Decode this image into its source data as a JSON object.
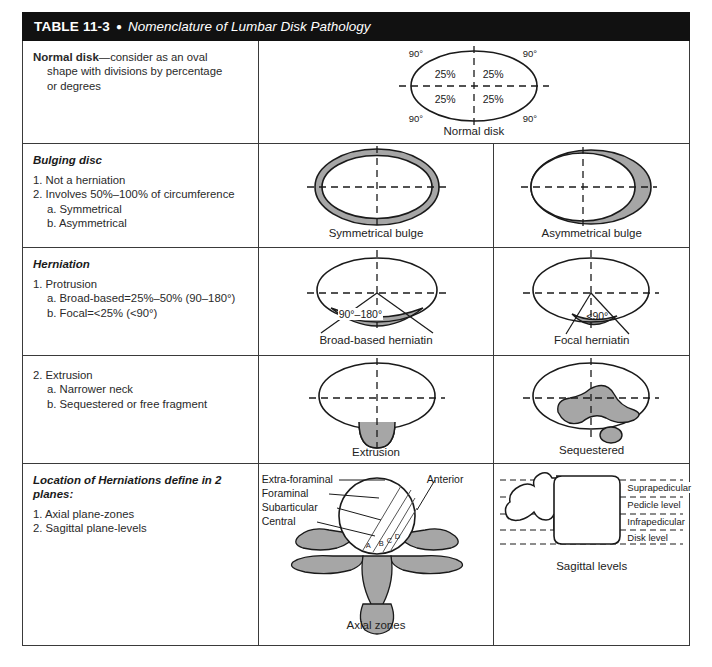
{
  "header": {
    "number": "TABLE 11-3",
    "separator": "●",
    "title": "Nomenclature of Lumbar Disk Pathology"
  },
  "rows": [
    {
      "id": "normal-disk",
      "text": {
        "heading": "Normal disk",
        "heading_style": "bold",
        "lines": [
          "—consider as an oval",
          "shape with divisions by percentage",
          "or degrees"
        ]
      },
      "figures": [
        {
          "id": "normal-disk-figure",
          "caption": "Normal disk",
          "labels": {
            "angle_top_left": "90°",
            "angle_top_right": "90°",
            "angle_bottom_left": "90°",
            "angle_bottom_right": "90°",
            "quad_top_left": "25%",
            "quad_top_right": "25%",
            "quad_bottom_left": "25%",
            "quad_bottom_right": "25%"
          }
        }
      ]
    },
    {
      "id": "bulging-disc",
      "text": {
        "heading": "Bulging disc",
        "heading_style": "bold-italic",
        "items": [
          "1. Not a herniation",
          "2. Involves 50%–100% of circumference",
          "a. Symmetrical",
          "b. Asymmetrical"
        ]
      },
      "figures": [
        {
          "id": "symmetrical-bulge-figure",
          "caption": "Symmetrical bulge"
        },
        {
          "id": "asymmetrical-bulge-figure",
          "caption": "Asymmetrical bulge"
        }
      ]
    },
    {
      "id": "herniation-protrusion",
      "text": {
        "heading": "Herniation",
        "heading_style": "bold-italic",
        "items": [
          "1. Protrusion",
          "a. Broad-based=25%–50% (90–180°)",
          "b. Focal=<25% (<90°)"
        ]
      },
      "figures": [
        {
          "id": "broad-based-figure",
          "caption": "Broad-based herniatin",
          "angle_label": "90°–180°"
        },
        {
          "id": "focal-figure",
          "caption": "Focal herniatin",
          "angle_label": "<90°"
        }
      ]
    },
    {
      "id": "herniation-extrusion",
      "text": {
        "items": [
          "2. Extrusion",
          "a. Narrower neck",
          "b. Sequestered or free fragment"
        ]
      },
      "figures": [
        {
          "id": "extrusion-figure",
          "caption": "Extrusion"
        },
        {
          "id": "sequestered-figure",
          "caption": "Sequestered"
        }
      ]
    },
    {
      "id": "location-of-herniations",
      "text": {
        "heading": "Location of Herniations define in 2 planes:",
        "heading_style": "bold-italic",
        "items": [
          "1. Axial plane-zones",
          "2. Sagittal plane-levels"
        ]
      },
      "figures": [
        {
          "id": "axial-zones-figure",
          "caption": "Axial zones",
          "labels": {
            "extra_foraminal": "Extra-foraminal",
            "foraminal": "Foraminal",
            "subarticular": "Subarticular",
            "central": "Central",
            "anterior": "Anterior",
            "marker_a": "A",
            "marker_b": "B",
            "marker_c": "C",
            "marker_d": "D"
          }
        },
        {
          "id": "sagittal-levels-figure",
          "caption": "Sagittal levels",
          "labels": {
            "suprapedicular": "Suprapedicular",
            "pedicle": "Pedicle level",
            "infrapedicular": "Infrapedicular",
            "disk": "Disk level"
          }
        }
      ]
    }
  ],
  "colors": {
    "header_bg": "#111111",
    "header_fg": "#ffffff",
    "border": "#3a3a3a",
    "shade_gray": "#a6a6a6",
    "outline": "#1a1a1a"
  }
}
